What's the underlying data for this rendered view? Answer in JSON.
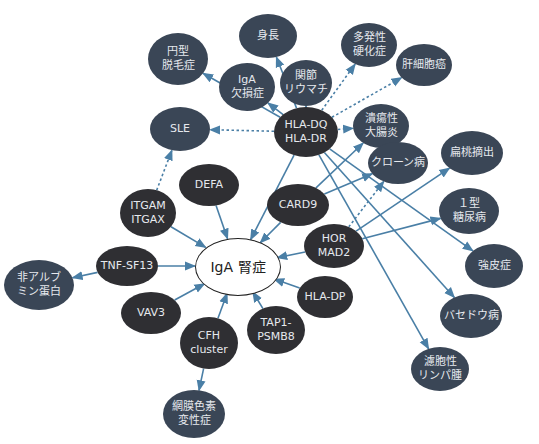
{
  "diagram": {
    "center": {
      "id": "iga",
      "label": "IgA 腎症",
      "x": 237,
      "y": 266,
      "rx": 42,
      "ry": 28
    },
    "colors": {
      "gene": "#2f2f33",
      "disease": "#3a4656",
      "edge": "#4a7fa6"
    },
    "genes": [
      {
        "id": "hladq",
        "label": "HLA-DQ\nHLA-DR",
        "x": 306,
        "y": 132,
        "rx": 32,
        "ry": 25
      },
      {
        "id": "defa",
        "label": "DEFA",
        "x": 209,
        "y": 185,
        "rx": 30,
        "ry": 21
      },
      {
        "id": "itgam",
        "label": "ITGAM\nITGAX",
        "x": 148,
        "y": 213,
        "rx": 28,
        "ry": 24
      },
      {
        "id": "card9",
        "label": "CARD9",
        "x": 298,
        "y": 205,
        "rx": 31,
        "ry": 21
      },
      {
        "id": "hormad2",
        "label": "HOR MAD2",
        "x": 334,
        "y": 246,
        "rx": 30,
        "ry": 22
      },
      {
        "id": "hladp",
        "label": "HLA-DP",
        "x": 325,
        "y": 297,
        "rx": 28,
        "ry": 21
      },
      {
        "id": "tap1",
        "label": "TAP1-\nPSMB8",
        "x": 276,
        "y": 330,
        "rx": 29,
        "ry": 24
      },
      {
        "id": "cfh",
        "label": "CFH\ncluster",
        "x": 209,
        "y": 343,
        "rx": 29,
        "ry": 26
      },
      {
        "id": "vav3",
        "label": "VAV3",
        "x": 151,
        "y": 313,
        "rx": 30,
        "ry": 21
      },
      {
        "id": "tnf",
        "label": "TNF-SF13",
        "x": 127,
        "y": 266,
        "rx": 31,
        "ry": 20
      }
    ],
    "diseases": [
      {
        "id": "enkei",
        "label": "円型\n脱毛症",
        "x": 178,
        "y": 59,
        "rx": 30,
        "ry": 26
      },
      {
        "id": "shincho",
        "label": "身長",
        "x": 268,
        "y": 36,
        "rx": 29,
        "ry": 22
      },
      {
        "id": "iga_def",
        "label": "IgA\n欠損症",
        "x": 247,
        "y": 87,
        "rx": 28,
        "ry": 24
      },
      {
        "id": "kansetsu",
        "label": "関節\nリウマチ",
        "x": 306,
        "y": 83,
        "rx": 26,
        "ry": 23
      },
      {
        "id": "tahatsu",
        "label": "多発性\n硬化症",
        "x": 369,
        "y": 45,
        "rx": 28,
        "ry": 22
      },
      {
        "id": "kansaibo",
        "label": "肝細胞癌",
        "x": 424,
        "y": 65,
        "rx": 28,
        "ry": 21
      },
      {
        "id": "kaiyosei",
        "label": "潰瘍性\n大腸炎",
        "x": 381,
        "y": 126,
        "rx": 28,
        "ry": 22
      },
      {
        "id": "sle",
        "label": "SLE",
        "x": 180,
        "y": 129,
        "rx": 30,
        "ry": 22
      },
      {
        "id": "crohn",
        "label": "クローン病",
        "x": 398,
        "y": 163,
        "rx": 30,
        "ry": 21
      },
      {
        "id": "hentou",
        "label": "扁桃摘出",
        "x": 472,
        "y": 153,
        "rx": 31,
        "ry": 22
      },
      {
        "id": "t1d",
        "label": "１型\n糖尿病",
        "x": 469,
        "y": 211,
        "rx": 30,
        "ry": 23
      },
      {
        "id": "kyohi",
        "label": "強皮症",
        "x": 494,
        "y": 266,
        "rx": 29,
        "ry": 22
      },
      {
        "id": "basedow",
        "label": "バセドウ病",
        "x": 471,
        "y": 316,
        "rx": 31,
        "ry": 22
      },
      {
        "id": "rosei",
        "label": "濾胞性\nリンパ腫",
        "x": 440,
        "y": 369,
        "rx": 29,
        "ry": 22
      },
      {
        "id": "hi_alb",
        "label": "非アルブ\nミン蛋白",
        "x": 39,
        "y": 285,
        "rx": 35,
        "ry": 25
      },
      {
        "id": "momaku",
        "label": "網膜色素\n変性症",
        "x": 194,
        "y": 414,
        "rx": 31,
        "ry": 24
      }
    ],
    "edges": [
      {
        "from": "hladq",
        "to": "iga",
        "style": "solid"
      },
      {
        "from": "hladq",
        "to": "enkei",
        "style": "solid"
      },
      {
        "from": "hladq",
        "to": "shincho",
        "style": "solid"
      },
      {
        "from": "hladq",
        "to": "iga_def",
        "style": "solid"
      },
      {
        "from": "hladq",
        "to": "kansetsu",
        "style": "solid"
      },
      {
        "from": "hladq",
        "to": "tahatsu",
        "style": "dotted"
      },
      {
        "from": "hladq",
        "to": "kansaibo",
        "style": "dotted"
      },
      {
        "from": "hladq",
        "to": "kaiyosei",
        "style": "dotted"
      },
      {
        "from": "hladq",
        "to": "sle",
        "style": "dotted"
      },
      {
        "from": "hladq",
        "to": "kyohi",
        "style": "solid"
      },
      {
        "from": "hladq",
        "to": "basedow",
        "style": "solid"
      },
      {
        "from": "hladq",
        "to": "rosei",
        "style": "solid"
      },
      {
        "from": "itgam",
        "to": "sle",
        "style": "dotted"
      },
      {
        "from": "itgam",
        "to": "iga",
        "style": "solid"
      },
      {
        "from": "defa",
        "to": "iga",
        "style": "solid"
      },
      {
        "from": "card9",
        "to": "iga",
        "style": "solid"
      },
      {
        "from": "card9",
        "to": "kaiyosei",
        "style": "solid"
      },
      {
        "from": "card9",
        "to": "crohn",
        "style": "solid"
      },
      {
        "from": "hormad2",
        "to": "iga",
        "style": "solid"
      },
      {
        "from": "hormad2",
        "to": "hentou",
        "style": "solid"
      },
      {
        "from": "hormad2",
        "to": "t1d",
        "style": "solid"
      },
      {
        "from": "hormad2",
        "to": "crohn",
        "style": "dotted"
      },
      {
        "from": "hladp",
        "to": "iga",
        "style": "solid"
      },
      {
        "from": "tap1",
        "to": "iga",
        "style": "solid"
      },
      {
        "from": "cfh",
        "to": "iga",
        "style": "solid"
      },
      {
        "from": "cfh",
        "to": "momaku",
        "style": "solid"
      },
      {
        "from": "vav3",
        "to": "iga",
        "style": "solid"
      },
      {
        "from": "tnf",
        "to": "iga",
        "style": "solid"
      },
      {
        "from": "tnf",
        "to": "hi_alb",
        "style": "solid"
      }
    ]
  }
}
